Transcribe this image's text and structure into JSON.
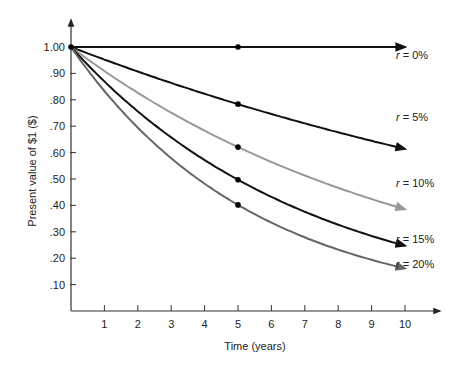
{
  "chart_data": {
    "type": "line",
    "title": "",
    "xlabel": "Time (years)",
    "ylabel": "Present value of $1 ($)",
    "xlim": [
      0,
      10
    ],
    "ylim": [
      0,
      1.0
    ],
    "x_ticks": [
      1,
      2,
      3,
      4,
      5,
      6,
      7,
      8,
      9,
      10
    ],
    "y_ticks": [
      {
        "value": 1.0,
        "label": "1.00"
      },
      {
        "value": 0.9,
        "label": ".90"
      },
      {
        "value": 0.8,
        "label": ".80"
      },
      {
        "value": 0.7,
        "label": ".70"
      },
      {
        "value": 0.6,
        "label": ".60"
      },
      {
        "value": 0.5,
        "label": ".50"
      },
      {
        "value": 0.4,
        "label": ".40"
      },
      {
        "value": 0.3,
        "label": ".30"
      },
      {
        "value": 0.2,
        "label": ".20"
      },
      {
        "value": 0.1,
        "label": ".10"
      }
    ],
    "grid": false,
    "legend_position": "inline-right",
    "series": [
      {
        "name": "r = 0%",
        "rate": 0.0,
        "color": "#111111",
        "marker_at_x": 5,
        "marker_value": 1.0,
        "end_value": 1.0
      },
      {
        "name": "r = 5%",
        "rate": 0.05,
        "color": "#111111",
        "marker_at_x": 5,
        "marker_value": 0.78,
        "end_value": 0.61
      },
      {
        "name": "r = 10%",
        "rate": 0.1,
        "color": "#999999",
        "marker_at_x": 5,
        "marker_value": 0.62,
        "end_value": 0.39
      },
      {
        "name": "r = 15%",
        "rate": 0.15,
        "color": "#111111",
        "marker_at_x": 5,
        "marker_value": 0.5,
        "end_value": 0.25
      },
      {
        "name": "r = 20%",
        "rate": 0.2,
        "color": "#666666",
        "marker_at_x": 5,
        "marker_value": 0.4,
        "end_value": 0.16
      }
    ]
  }
}
